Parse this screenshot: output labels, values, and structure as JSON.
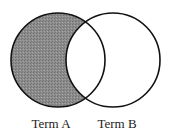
{
  "diagram": {
    "type": "venn",
    "sets": [
      {
        "id": "A",
        "label": "Term A",
        "shaded": true
      },
      {
        "id": "B",
        "label": "Term B",
        "shaded": false
      }
    ],
    "highlighted_region": "A only (A minus B)",
    "colors": {
      "shade": "#8a8a8a",
      "stroke": "#111111",
      "background": "#ffffff"
    }
  }
}
